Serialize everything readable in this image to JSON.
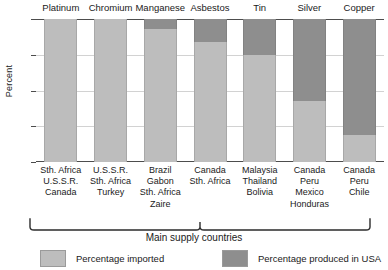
{
  "chart_data": {
    "type": "bar",
    "subtype": "stacked-100-percent",
    "title": "",
    "xlabel": "Main supply countries",
    "ylabel": "Percent",
    "ylim": [
      0,
      100
    ],
    "yticks": [
      0,
      25,
      50,
      75,
      100
    ],
    "ytick_labels": [
      "0",
      "25",
      "50",
      "75",
      "100"
    ],
    "grid": true,
    "legend_position": "bottom",
    "categories": [
      "Platinum",
      "Chromium",
      "Manganese",
      "Asbestos",
      "Tin",
      "Silver",
      "Copper"
    ],
    "series": [
      {
        "name": "Percentage imported",
        "color": "#bdbdbd",
        "values": [
          100,
          100,
          93,
          84,
          75,
          43,
          19
        ]
      },
      {
        "name": "Percentage produced in USA",
        "color": "#8e8e8e",
        "values": [
          0,
          0,
          7,
          16,
          25,
          57,
          81
        ]
      }
    ],
    "supply_countries": [
      [
        "Sth. Africa",
        "U.S.S.R.",
        "Canada"
      ],
      [
        "U.S.S.R.",
        "Sth. Africa",
        "Turkey"
      ],
      [
        "Brazil",
        "Gabon",
        "Sth. Africa",
        "Zaire"
      ],
      [
        "Canada",
        "Sth. Africa"
      ],
      [
        "Malaysia",
        "Thailand",
        "Bolivia"
      ],
      [
        "Canada",
        "Peru",
        "Mexico",
        "Honduras"
      ],
      [
        "Canada",
        "Peru",
        "Chile"
      ]
    ],
    "legend": [
      {
        "label": "Percentage imported",
        "swatch": "imported"
      },
      {
        "label": "Percentage produced in USA",
        "swatch": "domestic"
      }
    ]
  },
  "colors": {
    "imported": "#bdbdbd",
    "domestic": "#8e8e8e",
    "axis": "#4d4d4d",
    "grid": "#d2d2d2",
    "text": "#1a1a1a",
    "background": "#ffffff"
  }
}
